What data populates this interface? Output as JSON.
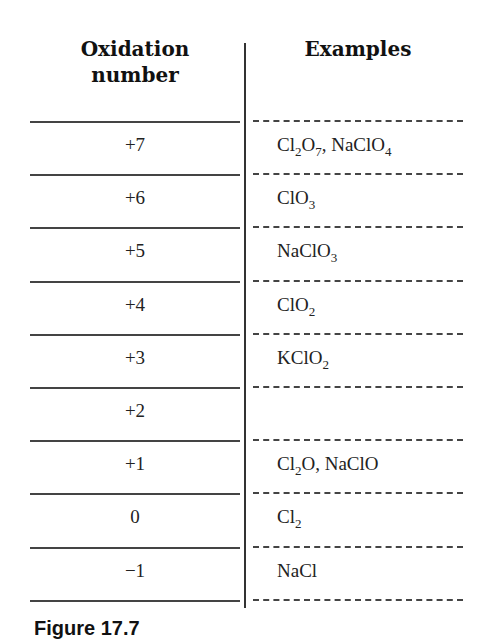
{
  "table": {
    "headers": {
      "oxidation": "Oxidation number",
      "oxidation_line1": "Oxidation",
      "oxidation_line2": "number",
      "examples": "Examples"
    },
    "rows": [
      {
        "oxidation": "+7",
        "examples": [
          {
            "t": "Cl"
          },
          {
            "s": "2"
          },
          {
            "t": "O"
          },
          {
            "s": "7"
          },
          {
            "t": ", NaClO"
          },
          {
            "s": "4"
          }
        ],
        "examples_text": "Cl2O7, NaClO4"
      },
      {
        "oxidation": "+6",
        "examples": [
          {
            "t": "ClO"
          },
          {
            "s": "3"
          }
        ],
        "examples_text": "ClO3"
      },
      {
        "oxidation": "+5",
        "examples": [
          {
            "t": "NaClO"
          },
          {
            "s": "3"
          }
        ],
        "examples_text": "NaClO3"
      },
      {
        "oxidation": "+4",
        "examples": [
          {
            "t": "ClO"
          },
          {
            "s": "2"
          }
        ],
        "examples_text": "ClO2"
      },
      {
        "oxidation": "+3",
        "examples": [
          {
            "t": "KClO"
          },
          {
            "s": "2"
          }
        ],
        "examples_text": "KClO2"
      },
      {
        "oxidation": "+2",
        "examples": [],
        "examples_text": ""
      },
      {
        "oxidation": "+1",
        "examples": [
          {
            "t": "Cl"
          },
          {
            "s": "2"
          },
          {
            "t": "O, NaClO"
          }
        ],
        "examples_text": "Cl2O, NaClO"
      },
      {
        "oxidation": "0",
        "examples": [
          {
            "t": "Cl"
          },
          {
            "s": "2"
          }
        ],
        "examples_text": "Cl2"
      },
      {
        "oxidation": "−1",
        "examples": [
          {
            "t": "NaCl"
          }
        ],
        "examples_text": "NaCl"
      }
    ]
  },
  "caption": "Figure 17.7"
}
